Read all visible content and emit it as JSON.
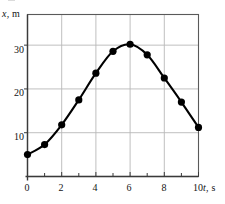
{
  "chart_data": {
    "type": "line",
    "title": "",
    "subtitle": "",
    "xlabel": "t, s",
    "ylabel": "x, m",
    "xlabel_symbol": "t",
    "xlabel_unit": ", s",
    "ylabel_symbol": "x",
    "ylabel_unit": ", m",
    "x": [
      0,
      1,
      2,
      3,
      4,
      5,
      6,
      7,
      8,
      9,
      10
    ],
    "values": [
      5.0,
      7.3,
      11.8,
      17.5,
      23.6,
      28.6,
      30.2,
      27.8,
      22.5,
      17.0,
      11.2
    ],
    "series": [
      {
        "name": "x(t)",
        "values": [
          5.0,
          7.3,
          11.8,
          17.5,
          23.6,
          28.6,
          30.2,
          27.8,
          22.5,
          17.0,
          11.2
        ]
      }
    ],
    "xlim": [
      0,
      10
    ],
    "ylim": [
      0,
      37
    ],
    "xticks": [
      0,
      2,
      4,
      6,
      8,
      10
    ],
    "xtick_labels": [
      "0",
      "2",
      "4",
      "6",
      "8",
      "10"
    ],
    "yticks": [
      10,
      20,
      30
    ],
    "ytick_labels": [
      "10",
      "20",
      "30"
    ],
    "x_minor_ticks": [
      1,
      3,
      5,
      7,
      9
    ],
    "grid": true,
    "grid_color": "#b8b8b8",
    "legend": null,
    "legend_position": "none",
    "marker": "filled-circle",
    "marker_color": "#000000",
    "line_color": "#000000",
    "frame_color": "#5a5a5a",
    "background_color": "#ffffff",
    "annotations": []
  }
}
